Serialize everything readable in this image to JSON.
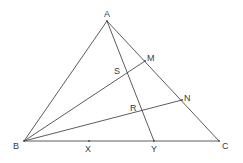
{
  "diagram": {
    "type": "geometry-triangle",
    "line_color": "#4a4a4a",
    "label_color": "#3a3a3a",
    "points": {
      "A": {
        "label": "A",
        "x": 107,
        "y": 21
      },
      "B": {
        "label": "B",
        "x": 24,
        "y": 141
      },
      "C": {
        "label": "C",
        "x": 219,
        "y": 141
      },
      "M": {
        "label": "M",
        "x": 145,
        "y": 61
      },
      "N": {
        "label": "N",
        "x": 182,
        "y": 100
      },
      "S": {
        "label": "S",
        "x": 127,
        "y": 72
      },
      "R": {
        "label": "R",
        "x": 142,
        "y": 111
      },
      "X": {
        "label": "X",
        "x": 89,
        "y": 141
      },
      "Y": {
        "label": "Y",
        "x": 154,
        "y": 141
      }
    },
    "segments": [
      [
        "A",
        "B"
      ],
      [
        "A",
        "C"
      ],
      [
        "B",
        "C"
      ],
      [
        "A",
        "Y"
      ],
      [
        "B",
        "M"
      ],
      [
        "B",
        "N"
      ]
    ],
    "labels": {
      "A": "A",
      "B": "B",
      "C": "C",
      "M": "M",
      "N": "N",
      "S": "S",
      "R": "R",
      "X": "X",
      "Y": "Y"
    }
  }
}
